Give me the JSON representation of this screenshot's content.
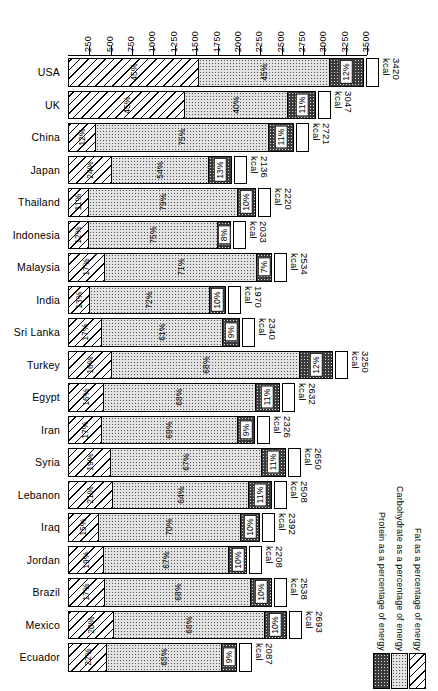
{
  "chart_data": {
    "type": "bar",
    "subtype": "stacked-horizontal",
    "title": "",
    "xlabel": "",
    "ylabel": "",
    "xlim": [
      0,
      3500
    ],
    "xticks": [
      250,
      500,
      750,
      1000,
      1250,
      1500,
      1750,
      2000,
      2250,
      2500,
      2750,
      3000,
      3250,
      3500
    ],
    "grid": false,
    "legend_position": "bottom-right",
    "unit": "kcal",
    "series": [
      {
        "name": "Fat as a percentage of energy",
        "key": "fat"
      },
      {
        "name": "Carbohydrate as a percentage of energy",
        "key": "carb"
      },
      {
        "name": "Protein as a percentage of energy",
        "key": "prot"
      }
    ],
    "categories": [
      "USA",
      "UK",
      "China",
      "Japan",
      "Thailand",
      "Indonesia",
      "Malaysia",
      "India",
      "Sri Lanka",
      "Turkey",
      "Egypt",
      "Iran",
      "Syria",
      "Lebanon",
      "Iraq",
      "Jordan",
      "Brazil",
      "Mexico",
      "Ecuador"
    ],
    "rows": [
      {
        "country": "USA",
        "fat_pct": "45%",
        "carb_pct": "45%",
        "prot_pct": "12%",
        "total": 3420,
        "fat": 45,
        "carb": 45,
        "prot": 12,
        "kcal_label": "3420\nkcal"
      },
      {
        "country": "UK",
        "fat_pct": "45%",
        "carb_pct": "40%",
        "prot_pct": "11%",
        "total": 3047,
        "fat": 45,
        "carb": 40,
        "prot": 11,
        "kcal_label": "3047\nkcal"
      },
      {
        "country": "China",
        "fat_pct": "12%",
        "carb_pct": "75%",
        "prot_pct": "11%",
        "total": 2721,
        "fat": 12,
        "carb": 75,
        "prot": 11,
        "kcal_label": "2721\nkcal"
      },
      {
        "country": "Japan",
        "fat_pct": "24%",
        "carb_pct": "54%",
        "prot_pct": "13%",
        "total": 2136,
        "fat": 24,
        "carb": 54,
        "prot": 13,
        "kcal_label": "2136\nkcal"
      },
      {
        "country": "Thailand",
        "fat_pct": "11%",
        "carb_pct": "79%",
        "prot_pct": "10%",
        "total": 2220,
        "fat": 11,
        "carb": 79,
        "prot": 10,
        "kcal_label": "2220\nkcal"
      },
      {
        "country": "Indonesia",
        "fat_pct": "12%",
        "carb_pct": "75%",
        "prot_pct": "8%",
        "total": 2033,
        "fat": 12,
        "carb": 75,
        "prot": 8,
        "kcal_label": "2033\nkcal"
      },
      {
        "country": "Malaysia",
        "fat_pct": "17%",
        "carb_pct": "71%",
        "prot_pct": "7%",
        "total": 2534,
        "fat": 17,
        "carb": 71,
        "prot": 7,
        "kcal_label": "2534\nkcal"
      },
      {
        "country": "India",
        "fat_pct": "13%",
        "carb_pct": "72%",
        "prot_pct": "10%",
        "total": 1970,
        "fat": 13,
        "carb": 72,
        "prot": 10,
        "kcal_label": "1970\nkcal"
      },
      {
        "country": "Sri Lanka",
        "fat_pct": "17%",
        "carb_pct": "61%",
        "prot_pct": "9%",
        "total": 2340,
        "fat": 17,
        "carb": 61,
        "prot": 9,
        "kcal_label": "2340\nkcal"
      },
      {
        "country": "Turkey",
        "fat_pct": "16%",
        "carb_pct": "68%",
        "prot_pct": "12%",
        "total": 3250,
        "fat": 16,
        "carb": 68,
        "prot": 12,
        "kcal_label": "3250\nkcal"
      },
      {
        "country": "Egypt",
        "fat_pct": "16%",
        "carb_pct": "68%",
        "prot_pct": "11%",
        "total": 2632,
        "fat": 16,
        "carb": 68,
        "prot": 11,
        "kcal_label": "2632\nkcal"
      },
      {
        "country": "Iran",
        "fat_pct": "17%",
        "carb_pct": "69%",
        "prot_pct": "9%",
        "total": 2326,
        "fat": 17,
        "carb": 69,
        "prot": 9,
        "kcal_label": "2326\nkcal"
      },
      {
        "country": "Syria",
        "fat_pct": "19%",
        "carb_pct": "67%",
        "prot_pct": "11%",
        "total": 2650,
        "fat": 19,
        "carb": 67,
        "prot": 11,
        "kcal_label": "2650\nkcal"
      },
      {
        "country": "Lebanon",
        "fat_pct": "21%",
        "carb_pct": "64%",
        "prot_pct": "11%",
        "total": 2508,
        "fat": 21,
        "carb": 64,
        "prot": 11,
        "kcal_label": "2508\nkcal"
      },
      {
        "country": "Iraq",
        "fat_pct": "15%",
        "carb_pct": "70%",
        "prot_pct": "10%",
        "total": 2392,
        "fat": 15,
        "carb": 70,
        "prot": 10,
        "kcal_label": "2392\nkcal"
      },
      {
        "country": "Jordan",
        "fat_pct": "19%",
        "carb_pct": "67%",
        "prot_pct": "10%",
        "total": 2208,
        "fat": 19,
        "carb": 67,
        "prot": 10,
        "kcal_label": "2208\nkcal"
      },
      {
        "country": "Brazil",
        "fat_pct": "17%",
        "carb_pct": "68%",
        "prot_pct": "10%",
        "total": 2538,
        "fat": 17,
        "carb": 68,
        "prot": 10,
        "kcal_label": "2538\nkcal"
      },
      {
        "country": "Mexico",
        "fat_pct": "20%",
        "carb_pct": "66%",
        "prot_pct": "10%",
        "total": 2693,
        "fat": 20,
        "carb": 66,
        "prot": 10,
        "kcal_label": "2693\nkcal"
      },
      {
        "country": "Ecuador",
        "fat_pct": "22%",
        "carb_pct": "65%",
        "prot_pct": "9%",
        "total": 2087,
        "fat": 22,
        "carb": 65,
        "prot": 9,
        "kcal_label": "2087\nkcal"
      }
    ]
  },
  "legend": {
    "entries": [
      {
        "label": "Fat as a percentage of energy",
        "swatch": "fat"
      },
      {
        "label": "Carbohydrate as a percentage of energy",
        "swatch": "carb"
      },
      {
        "label": "Protein as a percentage of energy",
        "swatch": "prot"
      }
    ]
  },
  "colors": {
    "fat": "#ffffff",
    "carb": "#e2e2e2",
    "protein": "#3a3a3a",
    "outline": "#000000"
  }
}
